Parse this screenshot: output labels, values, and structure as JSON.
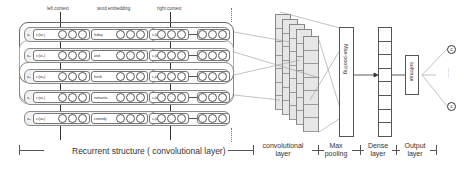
{
  "headers": {
    "left_context": "left context",
    "word_embedding": "word embedding",
    "right_context": "right context"
  },
  "rows": [
    {
      "x": "x₁",
      "left": "cₗ(w₁)",
      "word": "friday",
      "right": "cᵣ(w₁)",
      "y": "y₁⁽²⁾"
    },
    {
      "x": "x₂",
      "left": "cₗ(w₂)",
      "word": "and",
      "right": "cᵣ(w₂)",
      "y": "y₂⁽²⁾"
    },
    {
      "x": "x₃",
      "left": "cₗ(w₃)",
      "word": "fresh",
      "right": "cᵣ(w₃)",
      "y": "y₃⁽²⁾"
    },
    {
      "x": "x₄",
      "left": "cₗ(w₄)",
      "word": "romantic",
      "right": "cᵣ(w₄)",
      "y": "y₄⁽²⁾"
    },
    {
      "x": "x₅",
      "left": "cₗ(w₅)",
      "word": "comedy",
      "right": "cᵣ(w₅)",
      "y": "y₅⁽²⁾"
    }
  ],
  "blocks": {
    "max_pooling": "Max-pooling",
    "softmax": "softmax",
    "class_node": "c",
    "ellipsis": "……"
  },
  "bottom_labels": {
    "recurrent": "Recurrent structure ( convolutional layer)",
    "conv_line1": "convolutional",
    "conv_line2": "layer",
    "max_line1": "Max",
    "max_line2": "pooling",
    "dense_line1": "Dense",
    "dense_line2": "layer",
    "output_line1": "Output",
    "output_line2": "layer"
  },
  "colors": {
    "stroke": "#555555",
    "row_fill": "#f1f1f1",
    "feature_map_fill": "#e6e6e6"
  }
}
